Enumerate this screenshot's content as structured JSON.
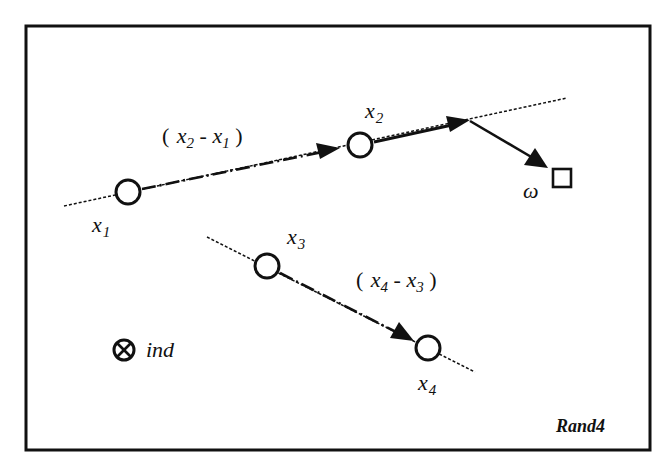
{
  "diagram": {
    "title_tag": "Rand4",
    "colors": {
      "stroke": "#111111",
      "background": "#ffffff"
    },
    "points": [
      {
        "id": "x1",
        "base": "x",
        "sub": "1"
      },
      {
        "id": "x2",
        "base": "x",
        "sub": "2"
      },
      {
        "id": "x3",
        "base": "x",
        "sub": "3"
      },
      {
        "id": "x4",
        "base": "x",
        "sub": "4"
      }
    ],
    "difference_labels": [
      {
        "open": "(",
        "a_base": "x",
        "a_sub": "2",
        "minus": "-",
        "b_base": "x",
        "b_sub": "1",
        "close": ")"
      },
      {
        "open": "(",
        "a_base": "x",
        "a_sub": "4",
        "minus": "-",
        "b_base": "x",
        "b_sub": "3",
        "close": ")"
      }
    ],
    "target_label": "ω",
    "legend": {
      "symbol": "circled-x",
      "label": "ind"
    }
  }
}
